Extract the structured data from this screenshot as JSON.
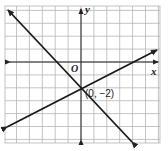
{
  "diagram": {
    "type": "coordinate-graph",
    "axes": {
      "x_label": "x",
      "y_label": "y",
      "origin_label": "O"
    },
    "grid": {
      "x_min": -6,
      "x_max": 6,
      "y_min": -7,
      "y_max": 4,
      "step": 1
    },
    "lines": [
      {
        "name": "line-decreasing",
        "slope": -1,
        "intercept": -2,
        "equation": "y = -x - 2"
      },
      {
        "name": "line-increasing",
        "slope": 0.5,
        "intercept": -2,
        "equation": "y = 0.5x - 2"
      }
    ],
    "intersection": {
      "x": 0,
      "y": -2,
      "label": "(0, −2)"
    }
  },
  "chart_data": {
    "type": "line",
    "title": "",
    "xlabel": "x",
    "ylabel": "y",
    "xlim": [
      -6,
      6
    ],
    "ylim": [
      -7,
      4
    ],
    "grid": true,
    "series": [
      {
        "name": "y = -x - 2",
        "x": [
          -6,
          4
        ],
        "y": [
          4,
          -6
        ]
      },
      {
        "name": "y = 0.5x - 2",
        "x": [
          -6,
          6
        ],
        "y": [
          -5,
          1
        ]
      }
    ],
    "annotations": [
      {
        "text": "(0, −2)",
        "x": 0,
        "y": -2
      },
      {
        "text": "O",
        "x": 0,
        "y": 0
      }
    ]
  }
}
